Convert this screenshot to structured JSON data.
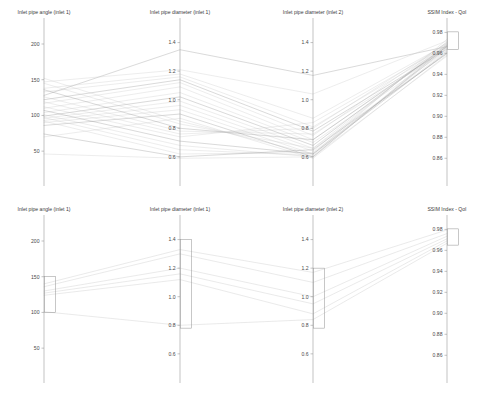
{
  "figure": {
    "kind": "parallel-coordinates",
    "panel_count": 2,
    "background_color": "#ffffff",
    "line_color": "#c8c8c8",
    "line_color_dark": "#8f8f8f",
    "axis_color": "#9a9a9a",
    "brush_color": "#9a9a9a"
  },
  "axes": [
    {
      "id": "inlet-pipe-angle-inlet-1",
      "title": "Inlet pipe angle (inlet 1)",
      "x": 44,
      "title_x": 44,
      "ticks": [
        200,
        150,
        100,
        50
      ],
      "tick_labels": [
        "200",
        "150",
        "100",
        "50"
      ],
      "range": [
        18,
        228
      ]
    },
    {
      "id": "inlet-pipe-diameter-inlet-1",
      "title": "Inlet pipe diameter (inlet 1)",
      "x": 180,
      "title_x": 180,
      "ticks": [
        1.4,
        1.2,
        1.0,
        0.8,
        0.6
      ],
      "tick_labels": [
        "1.4",
        "1.2",
        "1.0",
        "0.8",
        "0.6"
      ],
      "range": [
        0.48,
        1.53
      ]
    },
    {
      "id": "inlet-pipe-diameter-inlet-2",
      "title": "Inlet pipe diameter (inlet 2)",
      "x": 313,
      "title_x": 313,
      "ticks": [
        1.4,
        1.2,
        1.0,
        0.8,
        0.6
      ],
      "tick_labels": [
        "1.4",
        "1.2",
        "1.0",
        "0.8",
        "0.6"
      ],
      "range": [
        0.48,
        1.53
      ]
    },
    {
      "id": "ssim-index-qoi",
      "title": "SSIM Index - QoI",
      "x": 447,
      "title_x": 447,
      "ticks": [
        0.98,
        0.96,
        0.94,
        0.92,
        0.9,
        0.88,
        0.86
      ],
      "tick_labels": [
        "0.98",
        "0.96",
        "0.94",
        "0.92",
        "0.90",
        "0.88",
        "0.86"
      ],
      "range": [
        0.845,
        0.988
      ]
    }
  ],
  "chart_data": {
    "type": "line",
    "subtype": "parallel-coordinates",
    "title": "",
    "xlabel": "",
    "ylabel": "",
    "grid": false,
    "legend": "none",
    "dimensions": [
      "Inlet pipe angle (inlet 1)",
      "Inlet pipe diameter (inlet 1)",
      "Inlet pipe diameter (inlet 2)",
      "SSIM Index - QoI"
    ],
    "axis_ranges": [
      [
        18,
        228
      ],
      [
        0.48,
        1.53
      ],
      [
        0.48,
        1.53
      ],
      [
        0.845,
        0.988
      ]
    ],
    "panels": [
      {
        "name": "unfiltered",
        "label": "top",
        "series_count": 26,
        "brushes": [
          null,
          null,
          null,
          {
            "axis": "SSIM Index - QoI",
            "min": 0.9635,
            "max": 0.9805
          }
        ],
        "series": [
          {
            "name": "run-01",
            "values": [
              128,
              1.35,
              1.17,
              0.9665
            ]
          },
          {
            "name": "run-02",
            "values": [
              147,
              1.21,
              1.04,
              0.972
            ]
          },
          {
            "name": "run-03",
            "values": [
              138,
              1.18,
              0.87,
              0.969
            ]
          },
          {
            "name": "run-04",
            "values": [
              133,
              1.16,
              0.81,
              0.966
            ]
          },
          {
            "name": "run-05",
            "values": [
              122,
              1.14,
              0.78,
              0.964
            ]
          },
          {
            "name": "run-06",
            "values": [
              117,
              1.12,
              0.75,
              0.9705
            ]
          },
          {
            "name": "run-07",
            "values": [
              110,
              1.09,
              0.72,
              0.9655
            ]
          },
          {
            "name": "run-08",
            "values": [
              104,
              1.05,
              0.7,
              0.9625
            ]
          },
          {
            "name": "run-09",
            "values": [
              99,
              1.02,
              0.68,
              0.968
            ]
          },
          {
            "name": "run-10",
            "values": [
              96,
              0.99,
              0.66,
              0.96
            ]
          },
          {
            "name": "run-11",
            "values": [
              93,
              0.96,
              0.64,
              0.9712
            ]
          },
          {
            "name": "run-12",
            "values": [
              90,
              0.93,
              0.62,
              0.9648
            ]
          },
          {
            "name": "run-13",
            "values": [
              86,
              0.9,
              0.6,
              0.9672
            ]
          },
          {
            "name": "run-14",
            "values": [
              70,
              0.87,
              0.59,
              0.9585
            ]
          },
          {
            "name": "run-15",
            "values": [
              152,
              0.85,
              0.62,
              0.9735
            ]
          },
          {
            "name": "run-16",
            "values": [
              145,
              0.83,
              0.66,
              0.9695
            ]
          },
          {
            "name": "run-17",
            "values": [
              136,
              0.8,
              0.72,
              0.9665
            ]
          },
          {
            "name": "run-18",
            "values": [
              126,
              0.78,
              0.76,
              0.963
            ]
          },
          {
            "name": "run-19",
            "values": [
              119,
              0.76,
              0.8,
              0.97
            ]
          },
          {
            "name": "run-20",
            "values": [
              112,
              0.74,
              0.84,
              0.9675
            ]
          },
          {
            "name": "run-21",
            "values": [
              107,
              0.71,
              0.62,
              0.961
            ]
          },
          {
            "name": "run-22",
            "values": [
              101,
              0.68,
              0.6,
              0.9688
            ]
          },
          {
            "name": "run-23",
            "values": [
              97,
              0.65,
              0.61,
              0.9655
            ]
          },
          {
            "name": "run-24",
            "values": [
              92,
              0.62,
              0.63,
              0.962
            ]
          },
          {
            "name": "run-25",
            "values": [
              74,
              0.6,
              0.65,
              0.9598
            ]
          },
          {
            "name": "run-26",
            "values": [
              46,
              0.59,
              0.6,
              0.9575
            ]
          }
        ]
      },
      {
        "name": "filtered",
        "label": "bottom",
        "series_count": 6,
        "brushes": [
          {
            "axis": "Inlet pipe angle (inlet 1)",
            "min": 100,
            "max": 150
          },
          {
            "axis": "Inlet pipe diameter (inlet 1)",
            "min": 0.78,
            "max": 1.4
          },
          {
            "axis": "Inlet pipe diameter (inlet 2)",
            "min": 0.78,
            "max": 1.2
          },
          {
            "axis": "SSIM Index - QoI",
            "min": 0.965,
            "max": 0.9805
          }
        ],
        "series": [
          {
            "name": "sel-01",
            "values": [
              140,
              1.33,
              1.17,
              0.9795
            ]
          },
          {
            "name": "sel-02",
            "values": [
              136,
              1.3,
              1.1,
              0.976
            ]
          },
          {
            "name": "sel-03",
            "values": [
              130,
              1.2,
              1.0,
              0.9735
            ]
          },
          {
            "name": "sel-04",
            "values": [
              127,
              1.16,
              0.95,
              0.971
            ]
          },
          {
            "name": "sel-05",
            "values": [
              124,
              1.12,
              0.88,
              0.969
            ]
          },
          {
            "name": "sel-06",
            "values": [
              101,
              0.8,
              0.84,
              0.9668
            ]
          }
        ]
      }
    ]
  }
}
